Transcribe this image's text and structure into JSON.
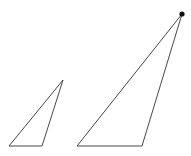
{
  "diagram": {
    "width": 191,
    "height": 156,
    "background": "#ffffff",
    "stroke_color": "#333333",
    "stroke_width": 0.9,
    "shapes": [
      {
        "name": "small-triangle",
        "points": [
          [
            9,
            146
          ],
          [
            42,
            146
          ],
          [
            63,
            80
          ]
        ]
      },
      {
        "name": "large-triangle",
        "points": [
          [
            77,
            146
          ],
          [
            142,
            146
          ],
          [
            182,
            14
          ]
        ]
      }
    ],
    "markers": [
      {
        "name": "vertex-dot",
        "cx": 182,
        "cy": 14,
        "r": 2.6,
        "fill": "#111111"
      }
    ]
  }
}
